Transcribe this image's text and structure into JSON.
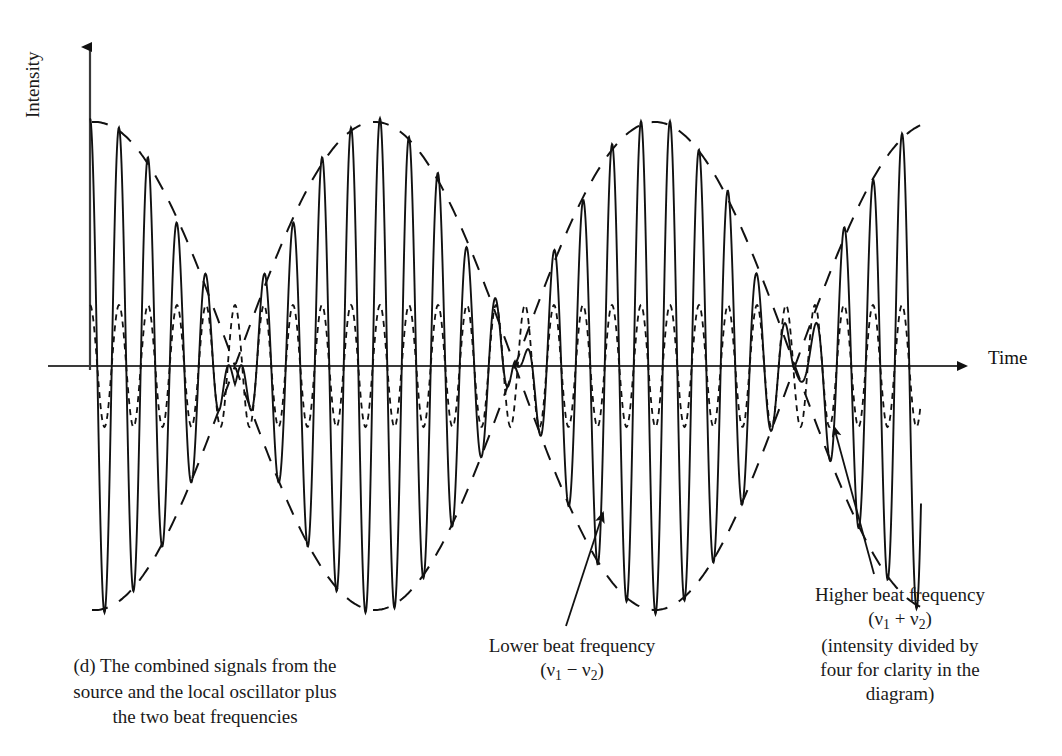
{
  "figure": {
    "panel_letter": "(d)",
    "caption_lines": [
      "(d) The combined signals from the",
      "source and the local oscillator plus",
      "the two beat frequencies"
    ],
    "axes": {
      "y_label": "Intensity",
      "x_label": "Time",
      "y_arrow": true,
      "x_arrow": true
    },
    "annotations": [
      {
        "name": "lower-beat-frequency",
        "line1": "Lower beat frequency",
        "line2_prefix": "(",
        "line2_sym1": "ν",
        "line2_sub1": "1",
        "line2_op": " − ",
        "line2_sym2": "ν",
        "line2_sub2": "2",
        "line2_suffix": ")"
      },
      {
        "name": "higher-beat-frequency",
        "line1": "Higher beat frequency",
        "line2_prefix": "(",
        "line2_sym1": "ν",
        "line2_sub1": "1",
        "line2_op": " + ",
        "line2_sym2": "ν",
        "line2_sub2": "2",
        "line2_suffix": ")",
        "line3": "(intensity divided by",
        "line4": "four for clarity in the",
        "line5": "diagram)"
      }
    ]
  },
  "chart_data": {
    "type": "line",
    "title": "",
    "subtitle": "",
    "xlabel": "Time",
    "ylabel": "Intensity",
    "grid": false,
    "legend": "none",
    "axis_origin_px": {
      "x": 90,
      "y": 366
    },
    "x_range_px": [
      48,
      975
    ],
    "y_range_px": [
      38,
      650
    ],
    "series": [
      {
        "name": "combined-signal",
        "style": "solid",
        "stroke": "#111111",
        "stroke_width": 1.9,
        "model": "carrier",
        "carrier_period_px": 29.0,
        "carrier_phase_px": 90,
        "amplitude_px": 248,
        "envelope_period_px": 560,
        "envelope_phase_px": 95,
        "x_start_px": 90,
        "x_end_px": 921,
        "note": "amplitude modulated by the slow envelope; peaks alternate tall/short as the two beat components add"
      },
      {
        "name": "lower-beat-envelope",
        "style": "long-dash",
        "stroke": "#111111",
        "stroke_width": 2.0,
        "dash_pattern": "16 13",
        "model": "envelope",
        "period_px": 560,
        "phase_px": 95,
        "amplitude_px": 244,
        "x_start_px": 92,
        "x_end_px": 925,
        "label": "Lower beat frequency (ν1 − ν2)"
      },
      {
        "name": "higher-beat-wave",
        "style": "short-dash",
        "stroke": "#111111",
        "stroke_width": 1.8,
        "dash_pattern": "6 5",
        "model": "constant-amplitude-sine",
        "period_px": 29.0,
        "phase_px": 90,
        "amplitude_px": 61,
        "x_start_px": 90,
        "x_end_px": 921,
        "label": "Higher beat frequency (ν1 + ν2), intensity divided by four"
      }
    ],
    "pointers": [
      {
        "name": "pointer-lower-beat",
        "from_px": [
          566,
          626
        ],
        "to_px": [
          603,
          513
        ],
        "arrow_head": "to"
      },
      {
        "name": "pointer-higher-beat",
        "from_px": [
          874,
          574
        ],
        "to_px": [
          834,
          427
        ],
        "arrow_head": "to"
      }
    ]
  }
}
